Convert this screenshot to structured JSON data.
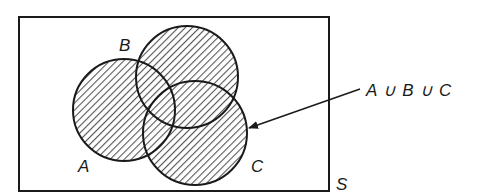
{
  "diagram": {
    "type": "venn",
    "universe": {
      "label": "S",
      "x": 19,
      "y": 17,
      "width": 310,
      "height": 174
    },
    "sets": [
      {
        "label": "A",
        "cx": 124,
        "cy": 110,
        "r": 51,
        "label_x": 78,
        "label_y": 172
      },
      {
        "label": "B",
        "cx": 187,
        "cy": 77,
        "r": 51,
        "label_x": 119,
        "label_y": 51
      },
      {
        "label": "C",
        "cx": 195,
        "cy": 133,
        "r": 52,
        "label_x": 251,
        "label_y": 172
      }
    ],
    "shaded_region": "union",
    "annotation": {
      "text": "A ∪ B ∪ C",
      "arrow_from": [
        360,
        89
      ],
      "arrow_to": [
        248,
        128
      ]
    },
    "colors": {
      "stroke": "#1a1a1a",
      "hatch": "#555555",
      "background": "#ffffff"
    }
  }
}
